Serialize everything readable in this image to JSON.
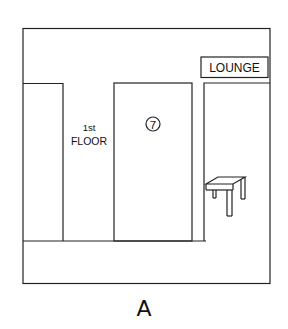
{
  "scene": {
    "sign": "LOUNGE",
    "floor_label_line1": "1st",
    "floor_label_line2": "FLOOR",
    "door_number": "7",
    "caption": "A"
  },
  "colors": {
    "ink": "#111111",
    "background": "#ffffff"
  }
}
